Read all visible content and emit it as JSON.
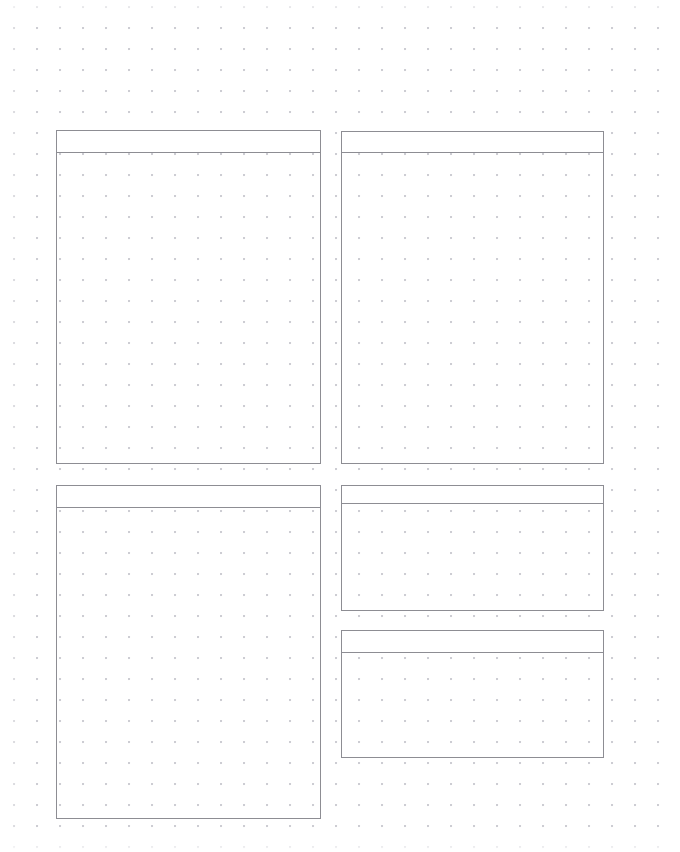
{
  "page": {
    "title": "",
    "background_color": "#ffffff",
    "width": 680,
    "height": 852
  },
  "grid": {
    "kind": "dot-grid",
    "dot_color": "#c9c9cf",
    "dot_spacing_x": 23,
    "dot_spacing_y": 21
  },
  "style": {
    "panel_border_color": "#8d8d93",
    "panel_fill": "transparent",
    "header_divider_color": "#8d8d93"
  },
  "panels": [
    {
      "id": "top-left",
      "header_label": "",
      "body_label": "",
      "x": 56,
      "y": 130,
      "width": 265,
      "height": 334,
      "header_height": 22
    },
    {
      "id": "top-right",
      "header_label": "",
      "body_label": "",
      "x": 341,
      "y": 131,
      "width": 263,
      "height": 333,
      "header_height": 21
    },
    {
      "id": "bottom-left",
      "header_label": "",
      "body_label": "",
      "x": 56,
      "y": 485,
      "width": 265,
      "height": 334,
      "header_height": 22
    },
    {
      "id": "middle-right",
      "header_label": "",
      "body_label": "",
      "x": 341,
      "y": 485,
      "width": 263,
      "height": 126,
      "header_height": 18
    },
    {
      "id": "bottom-right",
      "header_label": "",
      "body_label": "",
      "x": 341,
      "y": 630,
      "width": 263,
      "height": 128,
      "header_height": 22
    }
  ]
}
